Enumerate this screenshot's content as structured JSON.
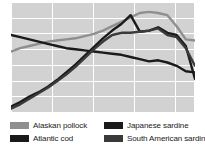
{
  "chart_data": {
    "type": "line",
    "title": "",
    "subtitle": "",
    "xlabel": "",
    "ylabel": "",
    "xlim": [
      0,
      20
    ],
    "ylim": [
      0,
      100
    ],
    "grid": true,
    "grid_color": "#ffffff",
    "plot_background": "#d2d2d2",
    "legend_position": "bottom",
    "x": [
      0,
      1,
      2,
      3,
      4,
      5,
      6,
      7,
      8,
      9,
      10,
      11,
      12,
      13,
      14,
      15,
      16,
      17,
      18,
      19,
      20
    ],
    "series": [
      {
        "name": "Alaskan pollock",
        "color": "#8f8f8f",
        "values": [
          55,
          58,
          60,
          62,
          64,
          65,
          66,
          67,
          69,
          71,
          74,
          78,
          82,
          86,
          90,
          91,
          90,
          88,
          78,
          66,
          65
        ]
      },
      {
        "name": "Atlantic cod",
        "color": "#1a1a1a",
        "values": [
          70,
          68,
          66,
          64,
          62,
          60,
          58,
          57,
          56,
          55,
          54,
          53,
          52,
          50,
          48,
          46,
          47,
          45,
          42,
          37,
          36
        ]
      },
      {
        "name": "Japanese sardine",
        "color": "#1a1a1a",
        "values": [
          5,
          9,
          14,
          18,
          23,
          29,
          36,
          43,
          51,
          59,
          67,
          74,
          80,
          88,
          73,
          74,
          77,
          72,
          70,
          60,
          30
        ]
      },
      {
        "name": "South American sardine",
        "color": "#3a3a3a",
        "values": [
          3,
          7,
          12,
          17,
          22,
          28,
          34,
          41,
          49,
          57,
          64,
          70,
          72,
          72,
          73,
          74,
          76,
          70,
          68,
          58,
          42
        ]
      }
    ]
  },
  "legend": {
    "columns": [
      {
        "items": [
          {
            "label": "Alaskan pollock",
            "color": "#8f8f8f",
            "swatch": "legend-swatch"
          },
          {
            "label": "Atlantic cod",
            "color": "#1a1a1a",
            "swatch": "legend-swatch"
          }
        ]
      },
      {
        "items": [
          {
            "label": "Japanese sardine",
            "color": "#1a1a1a",
            "swatch": "legend-swatch"
          },
          {
            "label": "South American sardine",
            "color": "#3a3a3a",
            "swatch": "legend-swatch"
          }
        ]
      }
    ]
  }
}
